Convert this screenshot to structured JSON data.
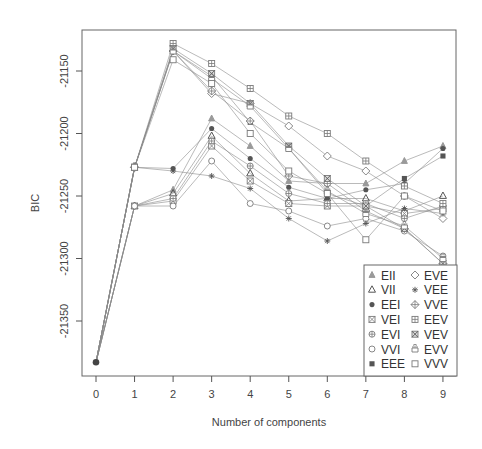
{
  "chart_data": {
    "type": "line",
    "title": "",
    "xlabel": "Number of components",
    "ylabel": "BIC",
    "x": [
      0,
      1,
      2,
      3,
      4,
      5,
      6,
      7,
      8,
      9
    ],
    "xticks": [
      "0",
      "1",
      "2",
      "3",
      "4",
      "5",
      "6",
      "7",
      "8",
      "9"
    ],
    "yticks": [
      "-21150",
      "-21200",
      "-21250",
      "-21300",
      "-21350"
    ],
    "ytick_values": [
      -21150,
      -21200,
      -21250,
      -21300,
      -21350
    ],
    "ylim": [
      -21388,
      -21117
    ],
    "xlim": [
      -0.35,
      9.35
    ],
    "grid": false,
    "legend_position": "bottom-right",
    "series": [
      {
        "name": "EII",
        "symbol": "triangle-filled",
        "values": [
          -21383,
          -21258,
          -21245,
          -21188,
          -21210,
          -21238,
          -21240,
          -21240,
          -21222,
          -21210
        ]
      },
      {
        "name": "VII",
        "symbol": "triangle-open",
        "values": [
          -21383,
          -21258,
          -21248,
          -21202,
          -21232,
          -21254,
          -21252,
          -21252,
          -21262,
          -21250
        ]
      },
      {
        "name": "EEI",
        "symbol": "circle-filled",
        "values": [
          -21383,
          -21227,
          -21228,
          -21196,
          -21220,
          -21243,
          -21252,
          -21245,
          -21240,
          -21212
        ]
      },
      {
        "name": "VEI",
        "symbol": "square-x",
        "values": [
          -21383,
          -21258,
          -21254,
          -21210,
          -21238,
          -21256,
          -21258,
          -21258,
          -21264,
          -21260
        ]
      },
      {
        "name": "EVI",
        "symbol": "circle-plus",
        "values": [
          -21383,
          -21258,
          -21252,
          -21206,
          -21226,
          -21248,
          -21256,
          -21256,
          -21268,
          -21258
        ]
      },
      {
        "name": "VVI",
        "symbol": "circle-open",
        "values": [
          -21383,
          -21258,
          -21258,
          -21222,
          -21256,
          -21262,
          -21274,
          -21268,
          -21278,
          -21298
        ]
      },
      {
        "name": "EEE",
        "symbol": "square-filled",
        "values": [
          -21383,
          -21227,
          -21134,
          -21154,
          -21191,
          -21212,
          -21248,
          -21258,
          -21236,
          -21218
        ]
      },
      {
        "name": "EVE",
        "symbol": "diamond-open",
        "values": [
          -21383,
          -21227,
          -21134,
          -21168,
          -21176,
          -21194,
          -21218,
          -21230,
          -21250,
          -21268
        ]
      },
      {
        "name": "VEE",
        "symbol": "asterisk",
        "values": [
          -21383,
          -21227,
          -21230,
          -21234,
          -21244,
          -21268,
          -21286,
          -21272,
          -21260,
          -21264
        ]
      },
      {
        "name": "VVE",
        "symbol": "diamond-plus",
        "values": [
          -21383,
          -21227,
          -21134,
          -21166,
          -21190,
          -21234,
          -21240,
          -21262,
          -21276,
          -21304
        ]
      },
      {
        "name": "EEV",
        "symbol": "square-plus",
        "values": [
          -21383,
          -21227,
          -21128,
          -21144,
          -21164,
          -21186,
          -21200,
          -21222,
          -21242,
          -21256
        ]
      },
      {
        "name": "VEV",
        "symbol": "square-x-boxed",
        "values": [
          -21383,
          -21227,
          -21132,
          -21152,
          -21176,
          -21210,
          -21236,
          -21258,
          -21276,
          -21304
        ]
      },
      {
        "name": "EVV",
        "symbol": "square-lid",
        "values": [
          -21383,
          -21227,
          -21134,
          -21156,
          -21178,
          -21212,
          -21246,
          -21264,
          -21274,
          -21300
        ]
      },
      {
        "name": "VVV",
        "symbol": "square-open",
        "values": [
          -21383,
          -21227,
          -21141,
          -21160,
          -21200,
          -21230,
          -21248,
          -21285,
          -21250,
          -21262
        ]
      }
    ]
  },
  "colors": {
    "axis": "#555555",
    "series_line": "#8a8a8a",
    "symbol": "#7a7a7a",
    "dark_symbol": "#555555"
  }
}
